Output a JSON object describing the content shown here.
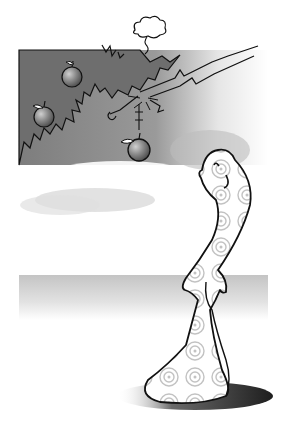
{
  "scene": {
    "description": "Cartoon figure looking up at an apple falling from a tree branch",
    "colors": {
      "background": "#ffffff",
      "sky_dark": "#8a8a8a",
      "foliage": "#6e6e6e",
      "apple": "#8c8c8c",
      "apple_highlight": "#c8c8c8",
      "outline": "#111111",
      "ground_band": "#cfcfcf",
      "shadow": "#3a3a3a",
      "swirl": "#bdbdbd"
    },
    "elements": {
      "tree": "apple tree with three apples",
      "falling_apple": "apple snapping off branch",
      "cloud": "small puff cloud above tree",
      "character": "bald smiling figure with swirl pattern looking up",
      "shadow": "elliptical ground shadow"
    }
  }
}
